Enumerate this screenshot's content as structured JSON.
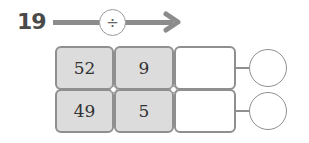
{
  "problem": {
    "number": "19",
    "operator": "÷",
    "operator_icon": "divide-icon",
    "rows": [
      {
        "dividend": "52",
        "divisor": "9",
        "quotient": "",
        "remainder": ""
      },
      {
        "dividend": "49",
        "divisor": "5",
        "quotient": "",
        "remainder": ""
      }
    ]
  },
  "colors": {
    "cell_fill": "#dcdcdc",
    "border": "#8f8f8f",
    "arrow": "#8c8c8c"
  }
}
